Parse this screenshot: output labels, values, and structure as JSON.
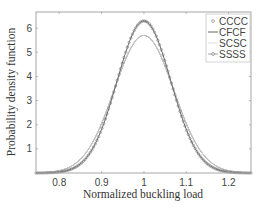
{
  "chart_data": {
    "type": "line",
    "title": "",
    "xlabel": "Normalized buckling load",
    "ylabel": "Probability density function",
    "xlim": [
      0.745,
      1.253
    ],
    "ylim": [
      0,
      6.67
    ],
    "xticks": [
      0.8,
      0.9,
      1,
      1.1,
      1.2
    ],
    "xtick_labels": [
      "0.8",
      "0.9",
      "1",
      "1.1",
      "1.2"
    ],
    "yticks": [
      1,
      2,
      3,
      4,
      5,
      6
    ],
    "ytick_labels": [
      "1",
      "2",
      "3",
      "4",
      "5",
      "6"
    ],
    "grid": false,
    "legend_position": "upper right",
    "series": [
      {
        "name": "CCCC",
        "marker": "circle",
        "line": "none",
        "mean": 1.0,
        "peak": 6.3,
        "x": [
          0.75,
          0.8,
          0.85,
          0.9,
          0.95,
          1.0,
          1.05,
          1.1,
          1.15,
          1.2,
          1.25
        ],
        "values": [
          0.0,
          0.04,
          0.37,
          1.81,
          4.67,
          6.3,
          4.67,
          1.81,
          0.37,
          0.04,
          0.0
        ]
      },
      {
        "name": "CFCF",
        "marker": "none",
        "line": "solid",
        "mean": 1.0,
        "peak": 5.7,
        "x": [
          0.75,
          0.8,
          0.85,
          0.9,
          0.95,
          1.0,
          1.05,
          1.1,
          1.15,
          1.2,
          1.25
        ],
        "values": [
          0.01,
          0.1,
          0.57,
          1.99,
          4.43,
          5.7,
          4.43,
          1.99,
          0.57,
          0.1,
          0.01
        ]
      },
      {
        "name": "SCSC",
        "marker": "none",
        "line": "light",
        "mean": 1.0,
        "peak": 5.7,
        "x": [
          0.75,
          0.8,
          0.85,
          0.9,
          0.95,
          1.0,
          1.05,
          1.1,
          1.15,
          1.2,
          1.25
        ],
        "values": [
          0.01,
          0.1,
          0.57,
          1.99,
          4.43,
          5.7,
          4.43,
          1.99,
          0.57,
          0.1,
          0.01
        ]
      },
      {
        "name": "SSSS",
        "marker": "circle",
        "line": "solid",
        "mean": 1.0,
        "peak": 6.3,
        "x": [
          0.75,
          0.8,
          0.85,
          0.9,
          0.95,
          1.0,
          1.05,
          1.1,
          1.15,
          1.2,
          1.25
        ],
        "values": [
          0.0,
          0.04,
          0.37,
          1.81,
          4.67,
          6.3,
          4.67,
          1.81,
          0.37,
          0.04,
          0.0
        ]
      }
    ]
  },
  "legend": {
    "items": [
      "CCCC",
      "CFCF",
      "SCSC",
      "SSSS"
    ]
  },
  "colors": {
    "axis": "#9a9a9a",
    "curve": "#6a6a6a",
    "marker": "#7a7a7a",
    "light_line": "#d8d8d8"
  }
}
